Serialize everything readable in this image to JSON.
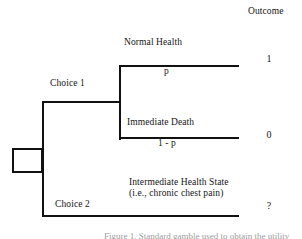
{
  "diagram": {
    "type": "decision-tree",
    "outcome_column_header": "Outcome",
    "decision_node": "",
    "branches": {
      "choice_1": {
        "label": "Choice 1",
        "chance_outcomes": [
          {
            "label": "Normal Health",
            "probability": "p",
            "outcome": "1"
          },
          {
            "label": "Immediate Death",
            "probability": "1 - p",
            "outcome": "0"
          }
        ]
      },
      "choice_2": {
        "label": "Choice 2",
        "state_label": "Intermediate Health State (i.e., chronic chest pain)",
        "outcome": "?"
      }
    },
    "bottom_caption": "Figure 1. Standard gamble used to obtain the utility"
  }
}
